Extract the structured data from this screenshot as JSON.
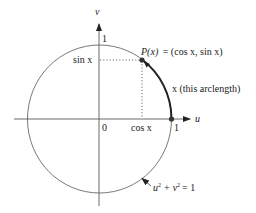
{
  "diagram": {
    "axes": {
      "u_label": "u",
      "v_label": "v",
      "origin_label": "0",
      "u_one_label": "1",
      "v_one_label": "1"
    },
    "labels": {
      "sin": "sin x",
      "cos": "cos x",
      "point_name": "P(x)",
      "point_eq": "= (cos x, sin x)",
      "arc_label": "x (this arclength)",
      "circle_eq_u": "u",
      "circle_eq_plus": "+",
      "circle_eq_v": "v",
      "circle_eq_end": "= 1",
      "sup": "2"
    },
    "colors": {
      "ink": "#222222",
      "thin": "#555555",
      "background": "#ffffff"
    }
  }
}
